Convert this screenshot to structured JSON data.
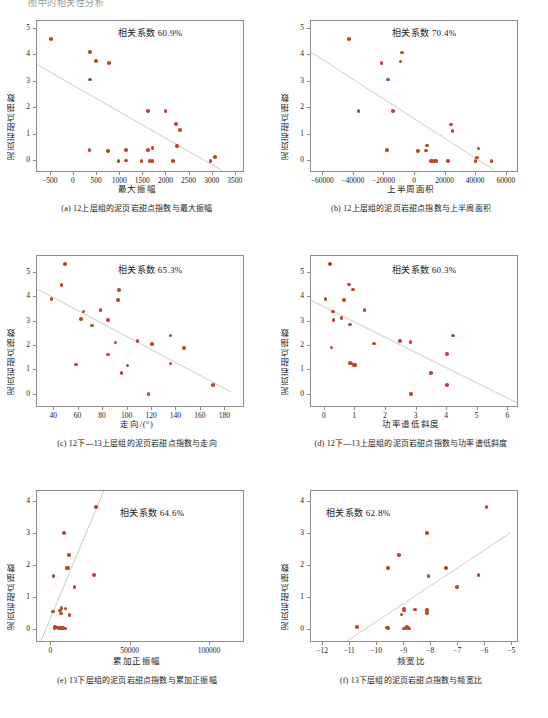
{
  "figure": {
    "header_fragment": "图中的相关性分析",
    "marker_color": "#b9482a",
    "fit_line_color": "#c9cdc9",
    "axis_color": "#8d8d8d",
    "y_axis_label": "泥页岩甜点指数"
  },
  "chart_data": [
    {
      "id": "a",
      "type": "scatter",
      "title": "",
      "caption": "(a) 12上层组的泥页岩甜点指数与最大振幅",
      "annotation": "相关系数 60.9%",
      "correlation": "60.9%",
      "xlabel": "最大振幅",
      "ylabel": "泥页岩甜点指数",
      "xlim": [
        -800,
        3700
      ],
      "ylim": [
        -0.45,
        5.3
      ],
      "xticks": [
        -500,
        0,
        500,
        1000,
        1500,
        2000,
        2500,
        3000,
        3500
      ],
      "xticklabels": [
        "−500",
        "0",
        "500",
        "1000",
        "1500",
        "2000",
        "2500",
        "3000",
        "3500"
      ],
      "yticks": [
        0,
        1,
        2,
        3,
        4,
        5
      ],
      "yticklabels": [
        "0",
        "1",
        "2",
        "3",
        "4",
        "5"
      ],
      "grid": false,
      "fit": {
        "x0": -800,
        "y0": 3.65,
        "x1": 3200,
        "y1": -0.35
      },
      "points": [
        [
          -500,
          4.63
        ],
        [
          350,
          4.12
        ],
        [
          480,
          3.79
        ],
        [
          760,
          3.72
        ],
        [
          350,
          3.09
        ],
        [
          1600,
          1.9
        ],
        [
          1980,
          1.9
        ],
        [
          2210,
          1.41
        ],
        [
          2290,
          1.18
        ],
        [
          2230,
          0.58
        ],
        [
          340,
          0.41
        ],
        [
          740,
          0.39
        ],
        [
          1120,
          0.42
        ],
        [
          1600,
          0.42
        ],
        [
          1700,
          0.49
        ],
        [
          960,
          0.01
        ],
        [
          1120,
          0.02
        ],
        [
          1460,
          0.01
        ],
        [
          1640,
          0.01
        ],
        [
          1700,
          0.01
        ],
        [
          2140,
          0.01
        ],
        [
          2950,
          0.01
        ],
        [
          3050,
          0.15
        ]
      ]
    },
    {
      "id": "b",
      "type": "scatter",
      "title": "",
      "caption": "(b) 12上层组的泥页岩甜点指数与上半周面积",
      "annotation": "相关系数 70.4%",
      "correlation": "70.4%",
      "xlabel": "上半周面积",
      "ylabel": "泥页岩甜点指数",
      "xlim": [
        -68000,
        68000
      ],
      "ylim": [
        -0.45,
        5.3
      ],
      "xticks": [
        -60000,
        -40000,
        -20000,
        0,
        20000,
        40000,
        60000
      ],
      "xticklabels": [
        "−60000",
        "−40000",
        "−20000",
        "0",
        "20000",
        "40000",
        "60000"
      ],
      "yticks": [
        0,
        1,
        2,
        3,
        4,
        5
      ],
      "yticklabels": [
        "0",
        "1",
        "2",
        "3",
        "4",
        "5"
      ],
      "grid": false,
      "fit": {
        "x0": -68000,
        "y0": 4.12,
        "x1": 52000,
        "y1": -0.35
      },
      "points": [
        [
          -43000,
          4.63
        ],
        [
          -8500,
          4.11
        ],
        [
          -22000,
          3.71
        ],
        [
          -9500,
          3.77
        ],
        [
          -17500,
          3.09
        ],
        [
          -37000,
          1.9
        ],
        [
          -14500,
          1.9
        ],
        [
          23500,
          1.39
        ],
        [
          24500,
          1.15
        ],
        [
          8000,
          0.59
        ],
        [
          -18500,
          0.42
        ],
        [
          2000,
          0.38
        ],
        [
          7000,
          0.4
        ],
        [
          41500,
          0.47
        ],
        [
          10500,
          0.01
        ],
        [
          11500,
          0.01
        ],
        [
          13000,
          0.01
        ],
        [
          14000,
          0.01
        ],
        [
          21500,
          0.01
        ],
        [
          39500,
          0.01
        ],
        [
          40500,
          0.13
        ],
        [
          50000,
          0.01
        ]
      ]
    },
    {
      "id": "c",
      "type": "scatter",
      "title": "",
      "caption": "(c) 12下—13上层组的泥页岩甜点指数与走向",
      "annotation": "相关系数 65.3%",
      "correlation": "65.3%",
      "xlabel": "走向/(°)",
      "ylabel": "泥页岩甜点指数",
      "xlim": [
        26,
        196
      ],
      "ylim": [
        -0.55,
        5.7
      ],
      "xticks": [
        40,
        60,
        80,
        100,
        120,
        140,
        160,
        180
      ],
      "xticklabels": [
        "40",
        "60",
        "80",
        "100",
        "120",
        "140",
        "160",
        "180"
      ],
      "yticks": [
        0,
        1,
        2,
        3,
        4,
        5
      ],
      "yticklabels": [
        "0",
        "1",
        "2",
        "3",
        "4",
        "5"
      ],
      "grid": false,
      "fit": {
        "x0": 26,
        "y0": 4.35,
        "x1": 185,
        "y1": 0.1
      },
      "points": [
        [
          49,
          5.36
        ],
        [
          46,
          4.5
        ],
        [
          38,
          3.92
        ],
        [
          93,
          4.31
        ],
        [
          92,
          3.89
        ],
        [
          64,
          3.41
        ],
        [
          78,
          3.47
        ],
        [
          62,
          3.12
        ],
        [
          84,
          3.08
        ],
        [
          71,
          2.85
        ],
        [
          135,
          2.43
        ],
        [
          108,
          2.21
        ],
        [
          120,
          2.09
        ],
        [
          90,
          2.15
        ],
        [
          146,
          1.91
        ],
        [
          84,
          1.65
        ],
        [
          135,
          1.28
        ],
        [
          58,
          1.24
        ],
        [
          100,
          1.2
        ],
        [
          95,
          0.88
        ],
        [
          117,
          0.03
        ],
        [
          170,
          0.39
        ]
      ]
    },
    {
      "id": "d",
      "type": "scatter",
      "title": "",
      "caption": "(d) 12下—13上层组的泥页岩甜点指数与功率谱低斜度",
      "annotation": "相关系数 60.3%",
      "correlation": "60.3%",
      "xlabel": "功率谱低斜度",
      "ylabel": "泥页岩甜点指数",
      "xlim": [
        -0.45,
        6.35
      ],
      "ylim": [
        -0.55,
        5.7
      ],
      "xticks": [
        0,
        1,
        2,
        3,
        4,
        5,
        6
      ],
      "xticklabels": [
        "0",
        "1",
        "2",
        "3",
        "4",
        "5",
        "6"
      ],
      "yticks": [
        0,
        1,
        2,
        3,
        4,
        5
      ],
      "yticklabels": [
        "0",
        "1",
        "2",
        "3",
        "4",
        "5"
      ],
      "grid": false,
      "fit": {
        "x0": -0.45,
        "y0": 3.88,
        "x1": 6.3,
        "y1": -0.35
      },
      "points": [
        [
          0.18,
          5.36
        ],
        [
          0.8,
          4.53
        ],
        [
          0.92,
          4.32
        ],
        [
          0.03,
          3.92
        ],
        [
          0.62,
          3.89
        ],
        [
          0.27,
          3.41
        ],
        [
          1.3,
          3.47
        ],
        [
          0.55,
          3.15
        ],
        [
          0.28,
          3.08
        ],
        [
          0.82,
          2.88
        ],
        [
          4.2,
          2.43
        ],
        [
          2.45,
          2.2
        ],
        [
          2.8,
          2.16
        ],
        [
          1.6,
          2.1
        ],
        [
          0.22,
          1.93
        ],
        [
          4.0,
          1.66
        ],
        [
          0.82,
          1.29
        ],
        [
          0.86,
          1.28
        ],
        [
          0.95,
          1.23
        ],
        [
          1.0,
          1.21
        ],
        [
          3.48,
          0.88
        ],
        [
          4.0,
          0.4
        ],
        [
          2.82,
          0.02
        ]
      ]
    },
    {
      "id": "e",
      "type": "scatter",
      "title": "",
      "caption": "(e) 13下层组的泥页岩甜点指数与累加正振幅",
      "annotation": "相关系数 64.6%",
      "correlation": "64.6%",
      "xlabel": "累加正振幅",
      "ylabel": "泥页岩甜点指数",
      "xlim": [
        -9000,
        122000
      ],
      "ylim": [
        -0.42,
        4.35
      ],
      "xticks": [
        0,
        50000,
        100000
      ],
      "xticklabels": [
        "0",
        "50000",
        "100000"
      ],
      "yticks": [
        0,
        1,
        2,
        3,
        4
      ],
      "yticklabels": [
        "0",
        "1",
        "2",
        "3",
        "4"
      ],
      "grid": false,
      "fit": {
        "x0": -6500,
        "y0": -0.35,
        "x1": 33000,
        "y1": 4.35
      },
      "points": [
        [
          28000,
          3.84
        ],
        [
          8000,
          3.03
        ],
        [
          11000,
          2.35
        ],
        [
          9500,
          1.94
        ],
        [
          10500,
          1.93
        ],
        [
          1500,
          1.69
        ],
        [
          27000,
          1.72
        ],
        [
          14500,
          1.34
        ],
        [
          6500,
          0.67
        ],
        [
          9000,
          0.66
        ],
        [
          5500,
          0.6
        ],
        [
          1000,
          0.57
        ],
        [
          6000,
          0.51
        ],
        [
          11500,
          0.45
        ],
        [
          2500,
          0.09
        ],
        [
          3500,
          0.07
        ],
        [
          4500,
          0.06
        ],
        [
          5500,
          0.06
        ],
        [
          6500,
          0.05
        ],
        [
          7500,
          0.05
        ],
        [
          8500,
          0.04
        ],
        [
          2000,
          0.03
        ]
      ]
    },
    {
      "id": "f",
      "type": "scatter",
      "title": "",
      "caption": "(f) 13下层组的泥页岩甜点指数与频宽比",
      "annotation": "相关系数 62.8%",
      "correlation": "62.8%",
      "xlabel": "频宽比",
      "ylabel": "泥页岩甜点指数",
      "xlim": [
        -12.45,
        -4.75
      ],
      "ylim": [
        -0.42,
        4.35
      ],
      "xticks": [
        -12,
        -11,
        -10,
        -9,
        -8,
        -7,
        -6,
        -5
      ],
      "xticklabels": [
        "−12",
        "−11",
        "−10",
        "−9",
        "−8",
        "−7",
        "−6",
        "−5"
      ],
      "yticks": [
        0,
        1,
        2,
        3,
        4
      ],
      "yticklabels": [
        "0",
        "1",
        "2",
        "3",
        "4"
      ],
      "grid": false,
      "fit": {
        "x0": -11.1,
        "y0": -0.35,
        "x1": -5.05,
        "y1": 3.05
      },
      "points": [
        [
          -5.95,
          3.84
        ],
        [
          -8.15,
          3.03
        ],
        [
          -9.2,
          2.35
        ],
        [
          -9.6,
          1.94
        ],
        [
          -7.45,
          1.94
        ],
        [
          -8.1,
          1.69
        ],
        [
          -6.25,
          1.72
        ],
        [
          -7.05,
          1.34
        ],
        [
          -9.0,
          0.66
        ],
        [
          -9.0,
          0.6
        ],
        [
          -8.6,
          0.63
        ],
        [
          -8.15,
          0.62
        ],
        [
          -9.1,
          0.47
        ],
        [
          -8.15,
          0.52
        ],
        [
          -10.75,
          0.09
        ],
        [
          -9.65,
          0.07
        ],
        [
          -9.6,
          0.05
        ],
        [
          -8.95,
          0.05
        ],
        [
          -8.85,
          0.05
        ],
        [
          -8.8,
          0.04
        ],
        [
          -9.0,
          0.03
        ],
        [
          -8.9,
          0.08
        ]
      ]
    }
  ]
}
